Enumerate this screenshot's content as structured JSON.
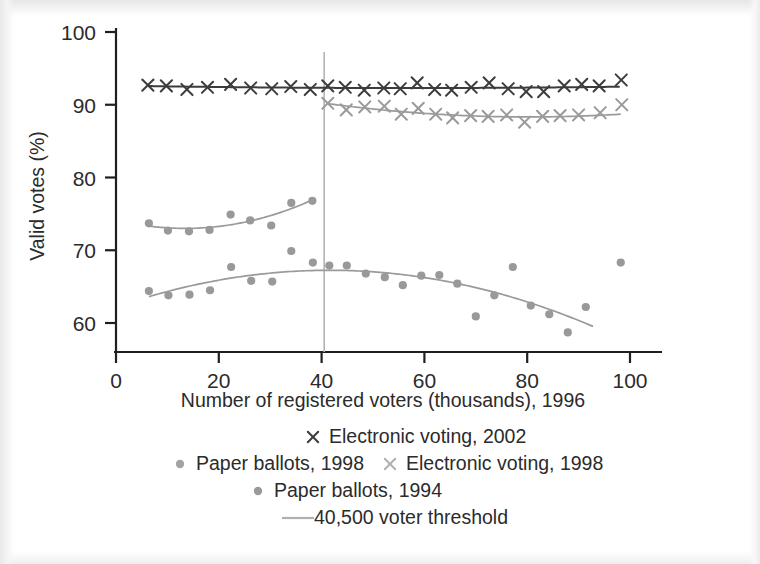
{
  "chart_data": {
    "type": "scatter",
    "title": "",
    "xlabel": "Number of registered voters (thousands), 1996",
    "ylabel": "Valid votes (%)",
    "xlim": [
      0,
      103
    ],
    "ylim": [
      56.5,
      100
    ],
    "xticks": [
      0,
      20,
      40,
      60,
      80,
      100
    ],
    "yticks": [
      60,
      70,
      80,
      90,
      100
    ],
    "grid": false,
    "legend_position": "below",
    "annotations": [
      {
        "name": "threshold-line",
        "type": "vline",
        "x": 40.5,
        "label": "40,500 voter threshold"
      }
    ],
    "series": [
      {
        "name": "Electronic voting, 2002",
        "marker": "x",
        "color": "#3c3c3c",
        "points": [
          [
            6.2,
            92.7
          ],
          [
            9.8,
            92.6
          ],
          [
            13.8,
            92.1
          ],
          [
            17.8,
            92.4
          ],
          [
            22.3,
            92.8
          ],
          [
            26.2,
            92.3
          ],
          [
            30.3,
            92.2
          ],
          [
            34.0,
            92.5
          ],
          [
            37.8,
            92.1
          ],
          [
            41.2,
            92.6
          ],
          [
            44.6,
            92.4
          ],
          [
            48.3,
            92.0
          ],
          [
            52.1,
            92.3
          ],
          [
            55.3,
            92.2
          ],
          [
            58.6,
            93.0
          ],
          [
            62.0,
            92.1
          ],
          [
            65.3,
            92.0
          ],
          [
            69.1,
            92.4
          ],
          [
            72.6,
            93.0
          ],
          [
            76.3,
            92.2
          ],
          [
            79.8,
            91.8
          ],
          [
            83.2,
            91.8
          ],
          [
            87.2,
            92.6
          ],
          [
            90.6,
            92.8
          ],
          [
            94.0,
            92.6
          ],
          [
            98.3,
            93.4
          ]
        ],
        "fit_color": "#3c3c3c"
      },
      {
        "name": "Electronic voting, 1998",
        "marker": "x",
        "color": "#9a9a9a",
        "points": [
          [
            41.2,
            90.2
          ],
          [
            44.8,
            89.3
          ],
          [
            48.4,
            89.7
          ],
          [
            52.2,
            89.8
          ],
          [
            55.5,
            88.7
          ],
          [
            58.8,
            89.5
          ],
          [
            62.2,
            88.7
          ],
          [
            65.5,
            88.2
          ],
          [
            69.0,
            88.5
          ],
          [
            72.4,
            88.4
          ],
          [
            76.0,
            88.6
          ],
          [
            79.5,
            87.6
          ],
          [
            83.0,
            88.4
          ],
          [
            86.4,
            88.5
          ],
          [
            90.0,
            88.6
          ],
          [
            94.2,
            88.9
          ],
          [
            98.4,
            90.0
          ]
        ],
        "fit_color": "#9a9a9a"
      },
      {
        "name": "Paper ballots, 1998",
        "marker": "o",
        "color": "#999999",
        "points": [
          [
            6.4,
            73.7
          ],
          [
            10.1,
            72.7
          ],
          [
            14.2,
            72.6
          ],
          [
            18.2,
            72.8
          ],
          [
            22.3,
            74.9
          ],
          [
            26.1,
            74.1
          ],
          [
            30.2,
            73.4
          ],
          [
            34.1,
            76.5
          ],
          [
            38.2,
            76.8
          ]
        ],
        "fit_color": "#9a9a9a"
      },
      {
        "name": "Paper ballots, 1994",
        "marker": "o",
        "color": "#999999",
        "points": [
          [
            6.4,
            64.4
          ],
          [
            10.2,
            63.8
          ],
          [
            14.3,
            63.9
          ],
          [
            18.3,
            64.5
          ],
          [
            22.4,
            67.7
          ],
          [
            26.3,
            65.8
          ],
          [
            30.4,
            65.7
          ],
          [
            34.1,
            69.9
          ],
          [
            38.3,
            68.3
          ],
          [
            41.5,
            67.9
          ],
          [
            44.9,
            67.9
          ],
          [
            48.6,
            66.8
          ],
          [
            52.3,
            66.3
          ],
          [
            55.8,
            65.2
          ],
          [
            59.4,
            66.5
          ],
          [
            62.9,
            66.6
          ],
          [
            66.4,
            65.4
          ],
          [
            70.0,
            60.9
          ],
          [
            73.6,
            63.8
          ],
          [
            77.2,
            67.7
          ],
          [
            80.7,
            62.4
          ],
          [
            84.3,
            61.2
          ],
          [
            87.9,
            58.7
          ],
          [
            91.4,
            62.2
          ],
          [
            98.2,
            68.3
          ]
        ],
        "fit_color": "#9a9a9a"
      }
    ]
  },
  "axes": {
    "y_label": "Valid votes (%)",
    "y_tick_labels": [
      "100",
      "90",
      "80",
      "70",
      "60"
    ],
    "x_label": "Number of registered voters (thousands), 1996",
    "x_tick_labels": [
      "0",
      "20",
      "40",
      "60",
      "80",
      "100"
    ]
  },
  "legend": {
    "rows": [
      {
        "items": [
          {
            "marker": "x",
            "color": "#3c3c3c",
            "label": "Electronic voting, 2002"
          }
        ]
      },
      {
        "items": [
          {
            "marker": "o",
            "color": "#a3a3a3",
            "label": "Paper ballots, 1998"
          },
          {
            "marker": "x",
            "color": "#b0b0b0",
            "label": "Electronic voting, 1998"
          }
        ]
      },
      {
        "items": [
          {
            "marker": "o",
            "color": "#9a9a9a",
            "label": "Paper ballots, 1994"
          }
        ]
      },
      {
        "items": [
          {
            "marker": "line",
            "color": "#b0b0b0",
            "label": "40,500 voter threshold"
          }
        ]
      }
    ]
  },
  "colors": {
    "dark_series": "#3c3c3c",
    "light_series": "#9a9a9a",
    "axis": "#1f1f1f",
    "text": "#2b2b2b",
    "threshold": "#b3b3b3"
  }
}
